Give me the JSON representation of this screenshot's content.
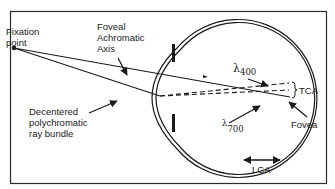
{
  "diagram": {
    "type": "eye-chromatic-aberration-schematic",
    "labels": {
      "fixation_point": [
        "Fixation",
        "point"
      ],
      "foveal_axis": [
        "Foveal",
        "Achromatic",
        "Axis"
      ],
      "decentered_bundle": [
        "Decentered",
        "polychromatic",
        "ray bundle"
      ],
      "lambda_400": {
        "symbol": "λ",
        "value": "400"
      },
      "lambda_700": {
        "symbol": "λ",
        "value": "700"
      },
      "tca": "TCA",
      "fovea": "Fovea",
      "lca": "LCA"
    },
    "colors": {
      "stroke": "#1a1a1a",
      "background": "#ffffff",
      "frame": "#2a2a2a"
    }
  }
}
